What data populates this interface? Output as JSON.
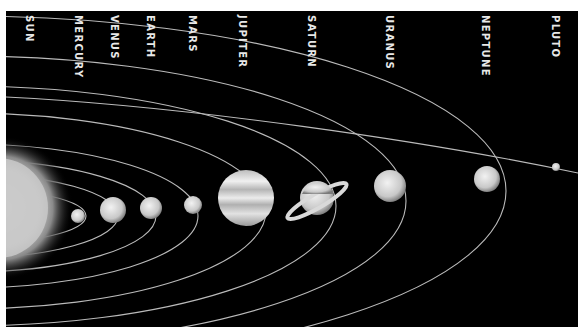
{
  "colors": {
    "background": "#000000",
    "label": "#e8e8e8",
    "orbit": "#cfcfcf",
    "border": "#ffffff"
  },
  "bodies": [
    {
      "name": "SUN",
      "label_x": 18
    },
    {
      "name": "MERCURY",
      "label_x": 67
    },
    {
      "name": "VENUS",
      "label_x": 103
    },
    {
      "name": "EARTH",
      "label_x": 139
    },
    {
      "name": "MARS",
      "label_x": 181
    },
    {
      "name": "JUPITER",
      "label_x": 231
    },
    {
      "name": "SATURN",
      "label_x": 300
    },
    {
      "name": "URANUS",
      "label_x": 378
    },
    {
      "name": "NEPTUNE",
      "label_x": 474
    },
    {
      "name": "PLUTO",
      "label_x": 544
    }
  ]
}
